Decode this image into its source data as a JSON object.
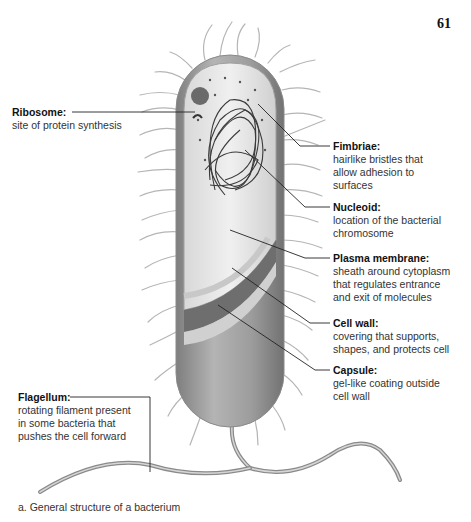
{
  "page": {
    "number": "61"
  },
  "figure": {
    "caption": "a. General structure of a bacterium",
    "subject": "bacterium",
    "colors": {
      "cell_body": "#9a9a9a",
      "cytoplasm": "#e4e4e4",
      "nucleoid": "#3a3a3a",
      "fimbriae": "#b8b8b8",
      "leader_line": "#222222"
    }
  },
  "labels": {
    "ribosome": {
      "title": "Ribosome:",
      "desc": "site of protein synthesis"
    },
    "fimbriae": {
      "title": "Fimbriae:",
      "desc": "hairlike bristles that\nallow adhesion to\nsurfaces"
    },
    "nucleoid": {
      "title": "Nucleoid:",
      "desc": "location of the bacterial\nchromosome"
    },
    "plasma_membrane": {
      "title": "Plasma membrane:",
      "desc": "sheath around cytoplasm\nthat regulates entrance\nand exit of molecules"
    },
    "cell_wall": {
      "title": "Cell wall:",
      "desc": "covering that supports,\nshapes, and protects cell"
    },
    "capsule": {
      "title": "Capsule:",
      "desc": "gel-like coating outside\ncell wall"
    },
    "flagellum": {
      "title": "Flagellum:",
      "desc": "rotating filament present\nin some bacteria that\npushes the cell forward"
    }
  }
}
